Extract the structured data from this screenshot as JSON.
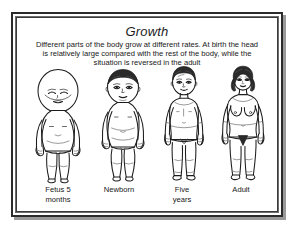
{
  "poster": {
    "title": "Growth",
    "description": "Different parts of the body grow at different rates. At birth the head is relatively large compared with the rest of the body, while the situation is reversed in the adult",
    "description_lines": [
      "Different parts of the body grow at different rates. At birth the head",
      "is relatively large compared with the rest of the body, while the",
      "situation is reversed in the adult"
    ],
    "figures": [
      {
        "id": "fetus",
        "label_lines": [
          "Fetus 5",
          "months"
        ],
        "label": "Fetus 5 months",
        "icon": "fetus-body-figure-icon"
      },
      {
        "id": "newborn",
        "label_lines": [
          "Newborn"
        ],
        "label": "Newborn",
        "icon": "newborn-body-figure-icon"
      },
      {
        "id": "five-years",
        "label_lines": [
          "Five",
          "years"
        ],
        "label": "Five years",
        "icon": "child-body-figure-icon"
      },
      {
        "id": "adult",
        "label_lines": [
          "Adult"
        ],
        "label": "Adult",
        "icon": "adult-body-figure-icon"
      }
    ],
    "colors": {
      "ink": "#1d1d1d",
      "paper": "#ffffff",
      "frame": "#2b2b2b",
      "shadow": "#9a9a9a"
    }
  }
}
